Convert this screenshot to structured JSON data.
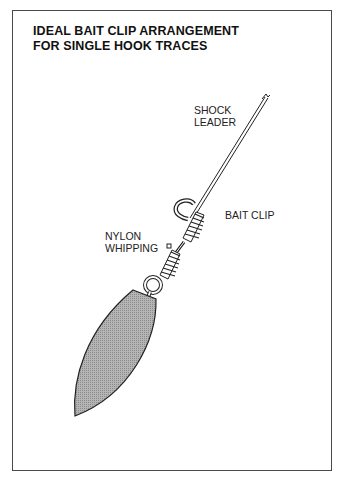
{
  "diagram": {
    "title_line1": "IDEAL BAIT CLIP ARRANGEMENT",
    "title_line2": "FOR SINGLE HOOK TRACES",
    "labels": {
      "shock_leader_line1": "SHOCK",
      "shock_leader_line2": "LEADER",
      "bait_clip": "BAIT CLIP",
      "nylon_whipping_line1": "NYLON",
      "nylon_whipping_line2": "WHIPPING"
    },
    "colors": {
      "ink": "#222222",
      "sinker_fill": "#a9a9a9",
      "frame": "#4a4a4a"
    }
  }
}
